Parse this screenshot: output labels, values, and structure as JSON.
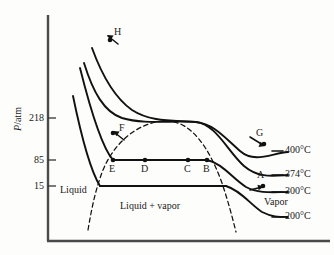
{
  "figure": {
    "kind": "pressure-volume-isotherm-diagram",
    "background_color": "#fdfdfb",
    "line_color": "#111111",
    "axis_color": "#3a3a3a"
  },
  "axes": {
    "y_title_symbol": "P",
    "y_title_unit": "/atm",
    "y_title_full": "P/atm",
    "x_title": "",
    "y_ticks": [
      {
        "label": "218",
        "y": 118
      },
      {
        "label": "85",
        "y": 160
      },
      {
        "label": "15",
        "y": 186
      }
    ],
    "origin_x": 48,
    "axis_top_y": 15,
    "axis_bottom_y": 241,
    "axis_right_x": 330
  },
  "region_labels": [
    {
      "text": "Liquid",
      "x": 60,
      "y": 185
    },
    {
      "text": "Liquid + vapor",
      "x": 120,
      "y": 201
    },
    {
      "text": "Vapor",
      "x": 264,
      "y": 197
    }
  ],
  "temperature_labels": [
    {
      "text": "400°C",
      "x": 285,
      "y": 150
    },
    {
      "text": "374°C",
      "x": 285,
      "y": 174
    },
    {
      "text": "300°C",
      "x": 285,
      "y": 191
    },
    {
      "text": "200°C",
      "x": 285,
      "y": 216
    }
  ],
  "point_labels": [
    {
      "text": "H",
      "x": 114,
      "y": 31
    },
    {
      "text": "F",
      "x": 119,
      "y": 127
    },
    {
      "text": "G",
      "x": 256,
      "y": 132
    },
    {
      "text": "A",
      "x": 257,
      "y": 174
    },
    {
      "text": "E",
      "x": 109,
      "y": 164
    },
    {
      "text": "D",
      "x": 141,
      "y": 164
    },
    {
      "text": "C",
      "x": 184,
      "y": 164
    },
    {
      "text": "B",
      "x": 203,
      "y": 164
    }
  ],
  "chart_data": {
    "type": "line",
    "title": "",
    "xlabel": "",
    "ylabel": "P/atm",
    "grid": false,
    "legend_position": "right-inline",
    "y_tick_values": [
      218,
      85,
      15
    ],
    "y_tick_labels": [
      "218",
      "85",
      "15"
    ],
    "annotations": [
      "Liquid",
      "Liquid + vapor",
      "Vapor",
      "H",
      "F",
      "G",
      "A",
      "E",
      "D",
      "C",
      "B"
    ],
    "series": [
      {
        "name": "400°C",
        "style": "solid",
        "label": "400°C",
        "path": "M 92,48 C 100,70 112,96 132,110 C 152,123 176,120 196,122 C 214,124 225,138 240,151 C 255,164 272,153 288,152"
      },
      {
        "name": "374°C",
        "style": "solid",
        "label": "374°C",
        "path": "M 84,63 C 93,92 104,112 122,118 C 145,125 172,120 196,122 C 216,124 228,152 244,166 C 258,178 272,176 288,175"
      },
      {
        "name": "300°C",
        "style": "solid",
        "label": "300°C",
        "path": "M 80,68 C 88,100 100,145 113,160 C 132,160 178,160 207,160 C 222,163 232,178 246,187 C 259,194 274,192 288,192"
      },
      {
        "name": "200°C",
        "style": "solid",
        "label": "200°C",
        "path": "M 73,96 C 80,130 90,170 100,186 C 130,186 190,186 226,186 C 240,190 250,204 262,212 C 272,217 278,217 288,217"
      },
      {
        "name": "coexistence-dome",
        "style": "dashed",
        "label": "",
        "path": "M 88,230 C 92,206 96,188 103,170 C 114,143 138,122 165,121 C 192,120 210,150 222,183 C 228,201 232,216 236,232"
      }
    ],
    "marked_points": [
      {
        "name": "H",
        "x": 110,
        "y": 40
      },
      {
        "name": "F",
        "x": 113,
        "y": 133
      },
      {
        "name": "E",
        "x": 113,
        "y": 160
      },
      {
        "name": "D",
        "x": 145,
        "y": 160
      },
      {
        "name": "C",
        "x": 188,
        "y": 160
      },
      {
        "name": "B",
        "x": 207,
        "y": 160
      },
      {
        "name": "G",
        "x": 264,
        "y": 144
      },
      {
        "name": "A",
        "x": 263,
        "y": 186
      }
    ],
    "isobar_segments": [
      {
        "name": "85-atm-tie-line",
        "y": 160,
        "x_start": 113,
        "x_end": 207
      },
      {
        "name": "15-atm-tie-line",
        "y": 186,
        "x_start": 100,
        "x_end": 226
      }
    ]
  }
}
